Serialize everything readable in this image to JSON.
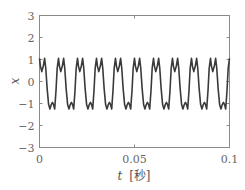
{
  "chart_data": {
    "type": "line",
    "title": "",
    "xlabel": "t [秒]",
    "xlabel_var": "t",
    "xlabel_unit": "[秒]",
    "ylabel": "x",
    "xlim": [
      0,
      0.1
    ],
    "ylim": [
      -3,
      3
    ],
    "x_ticks": [
      0,
      0.05,
      0.1
    ],
    "x_tick_labels": [
      "0",
      "0.05",
      "0.1"
    ],
    "y_ticks": [
      -3,
      -2,
      -1,
      0,
      1,
      2,
      3
    ],
    "y_tick_labels": [
      "−3",
      "−2",
      "−1",
      "0",
      "1",
      "2",
      "3"
    ],
    "grid": false,
    "legend": null,
    "series": [
      {
        "name": "x(t)",
        "color": "#3a3a3a",
        "description": "Periodic square-like wave with harmonic ripple; period 0.01 s (10 cycles in 0.1 s); top M-shaped plateau peaks ≈1.05 with dip ≈0.45; bottom W-shaped trough lows ≈-1.25 with middle ≈-0.95",
        "period": 0.01,
        "cycles": 10,
        "period_template": {
          "phase": [
            0.0,
            0.05,
            0.12,
            0.2,
            0.27,
            0.33,
            0.4,
            0.48,
            0.55,
            0.62,
            0.68,
            0.74,
            0.8,
            0.87,
            0.93,
            1.0
          ],
          "value": [
            1.05,
            0.7,
            0.45,
            0.7,
            1.05,
            0.6,
            -0.3,
            -1.05,
            -1.25,
            -1.05,
            -0.95,
            -1.05,
            -1.25,
            -0.4,
            0.6,
            1.05
          ]
        },
        "summary": {
          "max": 1.05,
          "min": -1.25,
          "top_dip": 0.45,
          "bottom_middle": -0.95,
          "value_at_t0": 1.05
        }
      }
    ]
  }
}
